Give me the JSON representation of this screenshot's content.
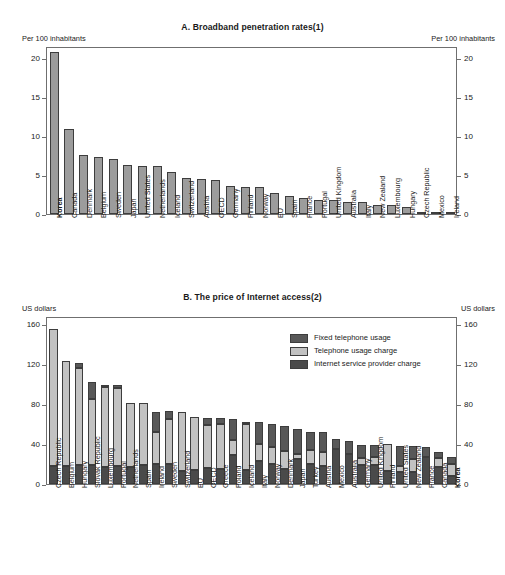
{
  "chart_data": [
    {
      "type": "bar",
      "panel": "A",
      "title": "A.  Broadband penetration rates(1)",
      "ylabel_left": "Per 100 inhabitants",
      "ylabel_right": "Per 100 inhabitants",
      "xlabel": "",
      "ylim": [
        0,
        21.5
      ],
      "yticks": [
        0,
        5,
        10,
        15,
        20
      ],
      "grid": false,
      "legend": "none",
      "highlight": "Korea",
      "categories": [
        "Korea",
        "Canada",
        "Denmark",
        "Belgium",
        "Sweden",
        "Japan",
        "United States",
        "Netherlands",
        "Iceland",
        "Switzerland",
        "Austria",
        "OECD",
        "Germany",
        "Finland",
        "Norway",
        "EU",
        "Spain",
        "France",
        "Portugal",
        "United Kingdom",
        "Australia",
        "Italy",
        "New Zealand",
        "Luxembourg",
        "Hungary",
        "Czech Republic",
        "Mexico",
        "Ireland"
      ],
      "values": [
        20.7,
        10.9,
        7.5,
        7.3,
        7.1,
        6.3,
        6.2,
        6.2,
        5.4,
        4.6,
        4.5,
        4.3,
        3.6,
        3.5,
        3.4,
        2.7,
        2.3,
        2.1,
        1.8,
        1.8,
        1.6,
        1.6,
        1.2,
        1.2,
        0.9,
        0.3,
        0.1,
        0.1
      ]
    },
    {
      "type": "bar",
      "subtype": "stacked",
      "panel": "B",
      "title": "B.  The price of Internet access(2)",
      "ylabel_left": "US dollars",
      "ylabel_right": "US dollars",
      "xlabel": "",
      "ylim": [
        0,
        168
      ],
      "yticks": [
        0,
        40,
        80,
        120,
        160
      ],
      "grid": false,
      "legend_position": "top-right",
      "highlight": "Korea",
      "categories": [
        "Czech Republic",
        "Belgium",
        "Hungary",
        "Slovak Republic",
        "Luxembourg",
        "Portugal",
        "Netherlands",
        "Spain",
        "Ireland",
        "Sweden",
        "Switzerland",
        "EU",
        "OECD",
        "Greece",
        "Poland",
        "Iceland",
        "Italy",
        "Norway",
        "Denmark",
        "Japan",
        "Turkey",
        "Austria",
        "Mexico",
        "Australia",
        "Germany",
        "United Kingdom",
        "Finland",
        "United States",
        "New Zealand",
        "France",
        "Canada",
        "Korea"
      ],
      "series": [
        {
          "name": "Internet service provider charge",
          "color": "#4a4a4a",
          "values": [
            18,
            18,
            19,
            19,
            17,
            18,
            17,
            19,
            20,
            20,
            13,
            14,
            16,
            15,
            29,
            14,
            23,
            20,
            15,
            25,
            20,
            18,
            35,
            30,
            19,
            19,
            13,
            12,
            12,
            27,
            17,
            8
          ]
        },
        {
          "name": "Telephone usage charge",
          "color": "#c2c2c2",
          "values": [
            137,
            105,
            97,
            66,
            80,
            78,
            64,
            62,
            32,
            45,
            59,
            53,
            43,
            45,
            15,
            46,
            17,
            17,
            18,
            5,
            14,
            14,
            0,
            0,
            7,
            8,
            27,
            6,
            13,
            0,
            9,
            12
          ]
        },
        {
          "name": "Fixed telephone usage",
          "color": "#585858",
          "values": [
            0,
            0,
            5,
            17,
            2,
            3,
            0,
            0,
            20,
            8,
            0,
            0,
            7,
            6,
            21,
            2,
            22,
            23,
            25,
            25,
            18,
            20,
            10,
            13,
            13,
            12,
            0,
            20,
            13,
            10,
            6,
            7
          ]
        }
      ]
    }
  ],
  "panelA": {
    "title": "A.  Broadband penetration rates(1)",
    "unit_left": "Per 100 inhabitants",
    "unit_right": "Per 100 inhabitants"
  },
  "panelB": {
    "title": "B.  The price of Internet access(2)",
    "unit_left": "US dollars",
    "unit_right": "US dollars",
    "legend": [
      {
        "label": "Fixed telephone usage",
        "swatch": "fixed"
      },
      {
        "label": "Telephone usage charge",
        "swatch": "telcharge"
      },
      {
        "label": "Internet service provider charge",
        "swatch": "isp"
      }
    ]
  }
}
